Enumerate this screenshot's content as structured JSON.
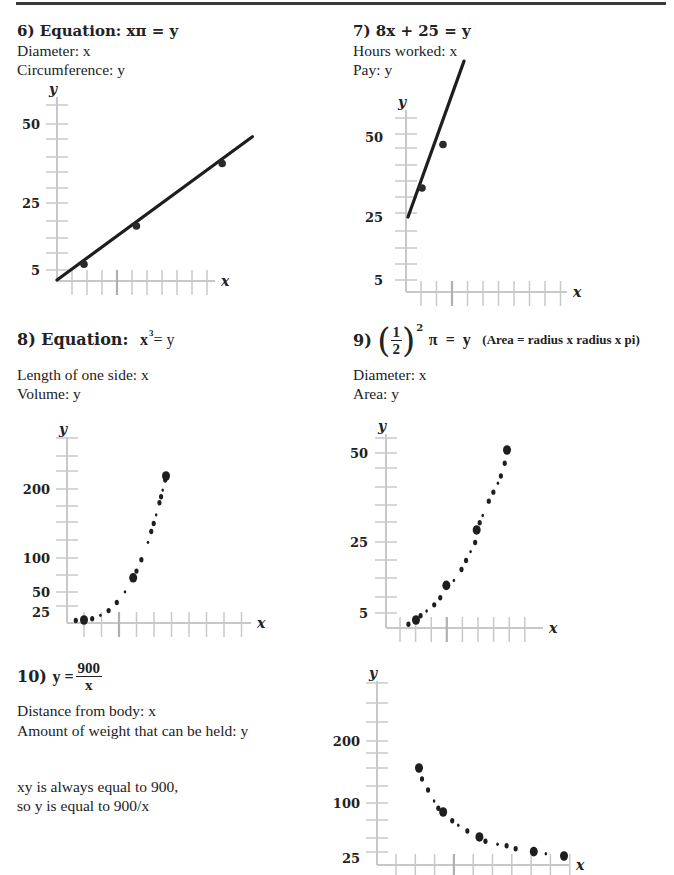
{
  "problems": {
    "p6": {
      "number": "6)",
      "heading": "Equation: xπ = y",
      "x_label": "Diameter: x",
      "y_label": "Circumference: y"
    },
    "p7": {
      "number": "7)",
      "heading": "8x + 25 = y",
      "x_label": "Hours worked: x",
      "y_label": "Pay: y"
    },
    "p8": {
      "number": "8)",
      "heading": "Equation:",
      "eq_base": "x",
      "eq_exp": "3",
      "eq_rest": "= y",
      "x_label": "Length of one side: x",
      "y_label": "Volume: y"
    },
    "p9": {
      "number": "9)",
      "paren_open": "(",
      "frac_num": "1",
      "frac_den": "2",
      "paren_close": ")",
      "eq_exp": "2",
      "eq_rest": "π  =  y",
      "note": "(Area = radius x radius x pi)",
      "x_label": "Diameter: x",
      "y_label": "Area: y"
    },
    "p10": {
      "number": "10)",
      "eq_lhs": "y =",
      "frac_num": "900",
      "frac_den": "x",
      "x_label": "Distance from body: x",
      "y_label": "Amount of weight that can be held: y",
      "explain_1": "xy is always equal to 900,",
      "explain_2": "so y  is equal to 900/x"
    }
  },
  "chart_data": [
    {
      "id": "chart6",
      "type": "line",
      "title": "xπ = y",
      "xlabel": "x",
      "ylabel": "y",
      "y_tick_labels": [
        "5",
        "25",
        "50"
      ],
      "x_tick_count": 10,
      "grid": false,
      "line": {
        "x": [
          0,
          12.3
        ],
        "y": [
          1,
          40
        ]
      },
      "points": {
        "x": [
          1.7,
          5,
          10.4
        ],
        "y": [
          5.3,
          15.7,
          32.7
        ]
      }
    },
    {
      "id": "chart7",
      "type": "line",
      "title": "8x + 25 = y",
      "xlabel": "x",
      "ylabel": "y",
      "y_tick_labels": [
        "5",
        "25",
        "50"
      ],
      "x_tick_count": 10,
      "grid": false,
      "line": {
        "x": [
          0,
          4
        ],
        "y": [
          25,
          68
        ]
      },
      "points": {
        "x": [
          1,
          2.5
        ],
        "y": [
          33,
          45
        ]
      }
    },
    {
      "id": "chart8",
      "type": "scatter",
      "title": "x³ = y",
      "xlabel": "x",
      "ylabel": "y",
      "y_tick_labels": [
        "25",
        "50",
        "100",
        "200"
      ],
      "x_tick_count": 10,
      "grid": false,
      "large_points": {
        "x": [
          1,
          4,
          6
        ],
        "y": [
          1,
          64,
          216
        ]
      },
      "small_points": {
        "x": [
          0.5,
          1.5,
          2,
          2.5,
          3,
          3.5,
          4.2,
          4.5,
          4.9,
          5.1,
          5.25,
          5.4,
          5.6,
          5.7,
          5.8,
          5.95
        ],
        "y": [
          0.1,
          3,
          8,
          15,
          27,
          43,
          74,
          91,
          117,
          133,
          145,
          158,
          176,
          185,
          195,
          210
        ]
      }
    },
    {
      "id": "chart9",
      "type": "scatter",
      "title": "(1/2)²π = y",
      "xlabel": "x",
      "ylabel": "y",
      "y_tick_labels": [
        "5",
        "25",
        "50"
      ],
      "x_tick_count": 9,
      "grid": false,
      "large_points": {
        "x": [
          2,
          4,
          6,
          8
        ],
        "y": [
          3,
          12.6,
          28,
          50.2
        ]
      },
      "small_points": {
        "x": [
          1.5,
          2.3,
          2.7,
          3.2,
          3.6,
          4.5,
          5,
          5.3,
          5.6,
          5.9,
          6.2,
          6.4,
          6.8,
          7.1,
          7.4,
          7.6,
          7.85
        ],
        "y": [
          1.8,
          4.2,
          5.5,
          7.2,
          9.2,
          14,
          17,
          19.5,
          22,
          24.5,
          30,
          32,
          36,
          38.5,
          41,
          43,
          46.5
        ]
      }
    },
    {
      "id": "chart10",
      "type": "scatter",
      "title": "y = 900/x",
      "xlabel": "x",
      "ylabel": "y",
      "y_tick_labels": [
        "25",
        "100",
        "200"
      ],
      "x_tick_count": 10,
      "grid": false,
      "large_points": {
        "x": [
          6,
          10,
          16,
          25,
          30
        ],
        "y": [
          150,
          90,
          56,
          36,
          30
        ]
      },
      "small_points": {
        "x": [
          6.5,
          7.5,
          8.5,
          9.2,
          11.5,
          12.5,
          14,
          17,
          19,
          20.5,
          22,
          27
        ],
        "y": [
          135,
          120,
          105,
          95,
          78,
          72,
          64,
          50,
          46,
          44,
          40,
          33
        ]
      }
    }
  ]
}
